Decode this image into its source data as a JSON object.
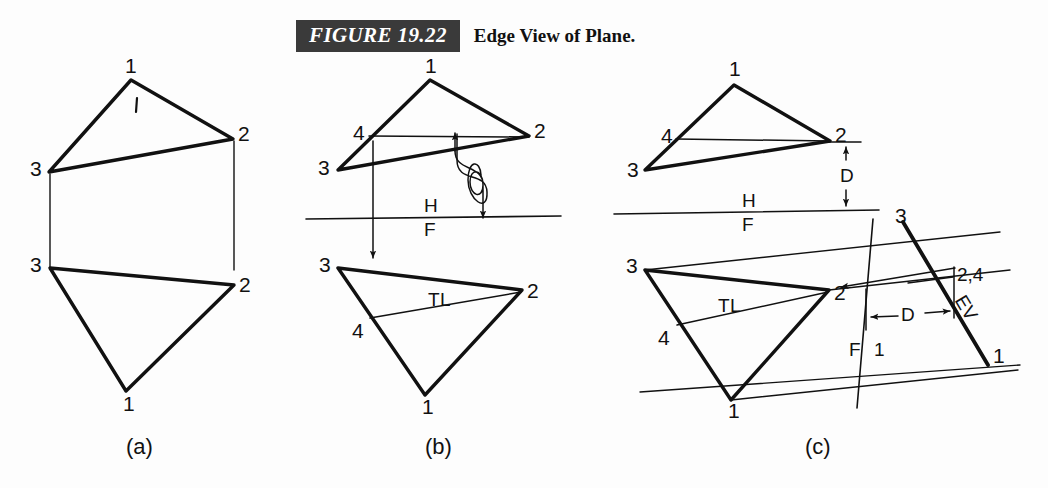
{
  "caption": {
    "tag": "FIGURE 19.22",
    "title": "Edge View of Plane."
  },
  "panels": [
    {
      "id": "a",
      "sublabel": "(a)"
    },
    {
      "id": "b",
      "sublabel": "(b)"
    },
    {
      "id": "c",
      "sublabel": "(c)"
    }
  ],
  "panel_a": {
    "top_view": {
      "vertex_1": "1",
      "vertex_2": "2",
      "vertex_3": "3",
      "tick_mark": "1"
    },
    "front_view": {
      "vertex_1": "1",
      "vertex_2": "2",
      "vertex_3": "3"
    }
  },
  "panel_b": {
    "top_view": {
      "vertex_1": "1",
      "vertex_2": "2",
      "vertex_3": "3",
      "vertex_4": "4"
    },
    "reference_line": {
      "upper": "H",
      "lower": "F"
    },
    "front_view": {
      "vertex_1": "1",
      "vertex_2": "2",
      "vertex_3": "3",
      "vertex_4": "4",
      "true_length": "TL"
    }
  },
  "panel_c": {
    "top_view": {
      "vertex_1": "1",
      "vertex_2": "2",
      "vertex_3": "3",
      "vertex_4": "4",
      "dimension": "D"
    },
    "reference_line_hf": {
      "upper": "H",
      "lower": "F"
    },
    "front_view": {
      "vertex_1": "1",
      "vertex_2": "2",
      "vertex_3": "3",
      "vertex_4": "4",
      "true_length": "TL"
    },
    "auxiliary_view": {
      "reference_line_f": "F",
      "reference_line_1": "1",
      "vertex_3": "3",
      "vertex_2_4": "2,4",
      "vertex_1": "1",
      "edge_view": "EV",
      "dimension": "D"
    }
  },
  "colors": {
    "ink": "#111111",
    "paper": "#fdfdfd",
    "caption_bar": "#3a3a3a",
    "caption_text": "#ffffff"
  }
}
